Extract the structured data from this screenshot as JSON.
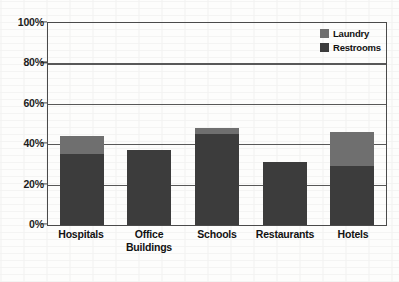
{
  "chart_data": {
    "type": "bar",
    "stacked": true,
    "title": "",
    "subtitle": "",
    "xlabel": "",
    "ylabel": "",
    "ylim": [
      0,
      100
    ],
    "yticks": [
      "0%",
      "20%",
      "40%",
      "60%",
      "80%",
      "100%"
    ],
    "ytick_values": [
      0,
      20,
      40,
      60,
      80,
      100
    ],
    "grid": true,
    "legend_position": "top-right",
    "categories": [
      "Hospitals",
      "Office Buildings",
      "Schools",
      "Restaurants",
      "Hotels"
    ],
    "category_lines": [
      [
        "Hospitals"
      ],
      [
        "Office",
        "Buildings"
      ],
      [
        "Schools"
      ],
      [
        "Restaurants"
      ],
      [
        "Hotels"
      ]
    ],
    "series": [
      {
        "name": "Restrooms",
        "color": "#3c3c3c",
        "values": [
          35,
          37,
          45,
          31,
          29
        ]
      },
      {
        "name": "Laundry",
        "color": "#6f6f6f",
        "values": [
          9,
          0,
          3,
          0,
          17
        ]
      }
    ],
    "totals": [
      44,
      37,
      48,
      31,
      46
    ]
  },
  "legend": {
    "items": [
      {
        "label": "Laundry",
        "color": "#6f6f6f"
      },
      {
        "label": "Restrooms",
        "color": "#3c3c3c"
      }
    ]
  }
}
